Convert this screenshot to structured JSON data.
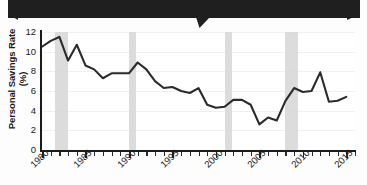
{
  "banner": {
    "text": ""
  },
  "chart_data": {
    "type": "line",
    "title": "",
    "xlabel": "",
    "ylabel": "Personal Savings Rate (%)",
    "xlim": [
      1980,
      2016
    ],
    "ylim": [
      0,
      12
    ],
    "ytick_labels": [
      "0",
      "2",
      "4",
      "6",
      "8",
      "10",
      "12"
    ],
    "yticks": [
      0,
      2,
      4,
      6,
      8,
      10,
      12
    ],
    "xtick_labels": [
      "1980",
      "1985",
      "1990",
      "1995",
      "2000",
      "2005",
      "2010",
      "2015"
    ],
    "xticks": [
      1980,
      1985,
      1990,
      1995,
      2000,
      2005,
      2010,
      2015
    ],
    "grid": true,
    "legend": "none",
    "line_color": "#2b2b2b",
    "band_color": "#d6d6d6",
    "shaded_bands": [
      {
        "label": "recession-1981-1982",
        "start": 1981.5,
        "end": 1983.0
      },
      {
        "label": "recession-1990-1991",
        "start": 1990.0,
        "end": 1990.8
      },
      {
        "label": "recession-2001",
        "start": 2001.0,
        "end": 2001.8
      },
      {
        "label": "recession-2008-2009",
        "start": 2008.0,
        "end": 2009.5
      }
    ],
    "x": [
      1980,
      1981,
      1982,
      1983,
      1984,
      1985,
      1986,
      1987,
      1988,
      1989,
      1990,
      1991,
      1992,
      1993,
      1994,
      1995,
      1996,
      1997,
      1998,
      1999,
      2000,
      2001,
      2002,
      2003,
      2004,
      2005,
      2006,
      2007,
      2008,
      2009,
      2010,
      2011,
      2012,
      2013,
      2014,
      2015
    ],
    "values": [
      10.5,
      11.1,
      11.5,
      9.1,
      10.7,
      8.6,
      8.2,
      7.3,
      7.8,
      7.8,
      7.8,
      8.9,
      8.2,
      7.0,
      6.3,
      6.4,
      6.0,
      5.8,
      6.3,
      4.6,
      4.3,
      4.4,
      5.1,
      5.1,
      4.6,
      2.6,
      3.3,
      3.0,
      5.0,
      6.3,
      5.9,
      6.0,
      7.9,
      4.9,
      5.0,
      5.4
    ],
    "series_name": "Personal Savings Rate"
  }
}
